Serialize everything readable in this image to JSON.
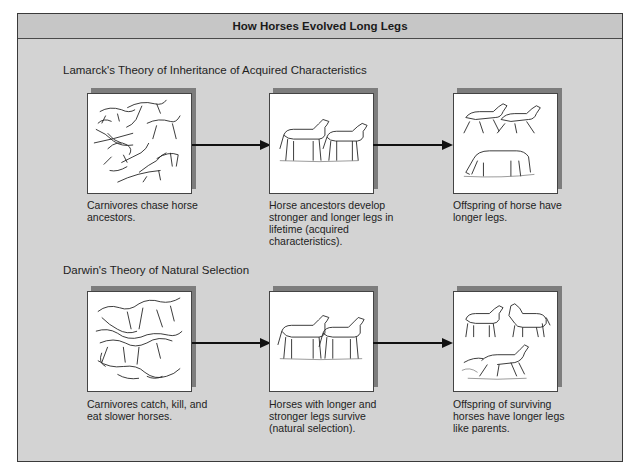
{
  "figure": {
    "title": "How Horses Evolved Long Legs",
    "colors": {
      "frame_bg": "#d3d3d3",
      "header_bg": "#c6c6c6",
      "panel_shadow": "#7d7d7d",
      "arrow": "#111111"
    }
  },
  "rows": [
    {
      "title": "Lamarck's Theory of Inheritance of Acquired Characteristics",
      "panels": [
        {
          "illustration": "carnivores-chasing-horses",
          "caption": "Carnivores chase horse ancestors."
        },
        {
          "illustration": "two-horses-standing",
          "caption": "Horse ancestors develop stronger and longer legs in lifetime (acquired characteristics)."
        },
        {
          "illustration": "offspring-horses-running-and-grazing",
          "caption": "Offspring of horse have longer legs."
        }
      ]
    },
    {
      "title": "Darwin's Theory of Natural Selection",
      "panels": [
        {
          "illustration": "carnivores-attacking-horses",
          "caption": "Carnivores catch, kill, and eat slower horses."
        },
        {
          "illustration": "two-horses-standing",
          "caption": "Horses with longer and stronger legs survive (natural selection)."
        },
        {
          "illustration": "offspring-horses-standing-and-running",
          "caption": "Offspring of surviving horses have longer legs like parents."
        }
      ]
    }
  ]
}
